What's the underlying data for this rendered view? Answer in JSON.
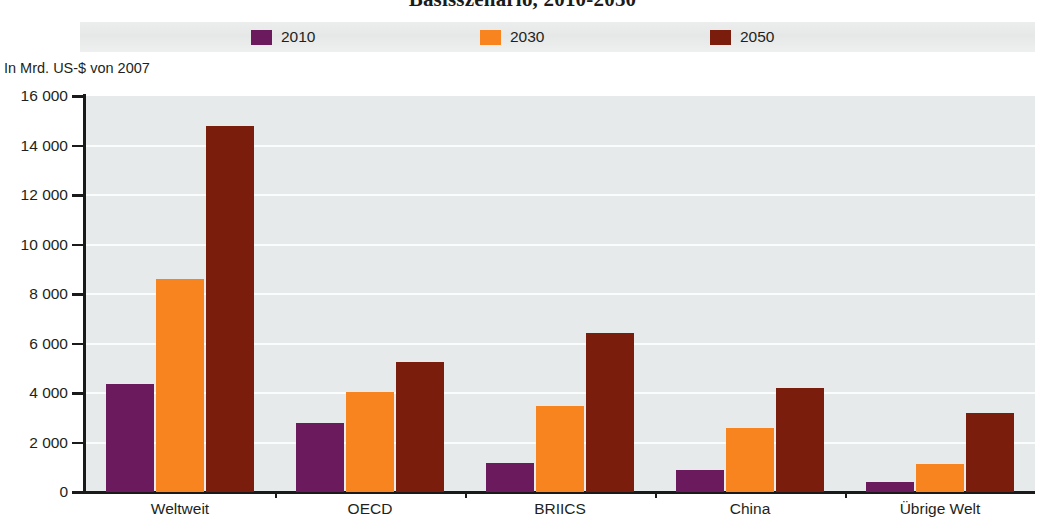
{
  "chart_title": "Basisszenario, 2010-2050",
  "legend": {
    "items": [
      {
        "label": "2010",
        "color": "#6B1A5E"
      },
      {
        "label": "2030",
        "color": "#F7841F"
      },
      {
        "label": "2050",
        "color": "#7B1D0C"
      }
    ]
  },
  "axis_unit_label": "In Mrd. US-$ von 2007",
  "chart_data": {
    "type": "bar",
    "title": "Basisszenario, 2010-2050",
    "xlabel": "",
    "ylabel": "In Mrd. US-$ von 2007",
    "ylim": [
      0,
      16000
    ],
    "ytick_labels": [
      "16 000",
      "14 000",
      "12 000",
      "10 000",
      "8 000",
      "6 000",
      "4 000",
      "2 000",
      "0"
    ],
    "ytick_values": [
      16000,
      14000,
      12000,
      10000,
      8000,
      6000,
      4000,
      2000,
      0
    ],
    "grid": true,
    "legend_position": "top",
    "categories": [
      "Weltweit",
      "OECD",
      "BRIICS",
      "China",
      "Übrige Welt"
    ],
    "series": [
      {
        "name": "2010",
        "color": "#6B1A5E",
        "values": [
          4350,
          2800,
          1170,
          890,
          400
        ]
      },
      {
        "name": "2030",
        "color": "#F7841F",
        "values": [
          8600,
          4050,
          3470,
          2590,
          1130
        ]
      },
      {
        "name": "2050",
        "color": "#7B1D0C",
        "values": [
          14800,
          5250,
          6430,
          4200,
          3190
        ]
      }
    ]
  }
}
